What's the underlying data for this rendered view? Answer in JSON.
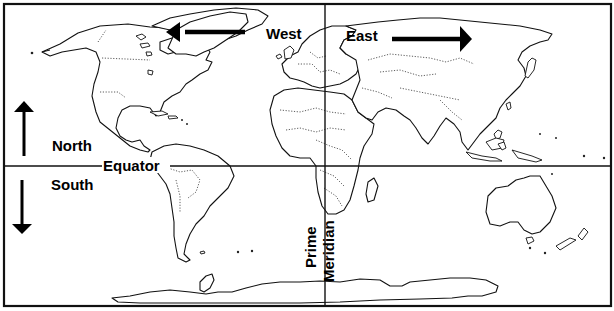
{
  "map": {
    "type": "world outline map",
    "reference_lines": {
      "equator": {
        "label": "Equator",
        "latitude": 0
      },
      "prime_meridian": {
        "label_line1": "Prime",
        "label_line2": "Meridian",
        "longitude": 0
      }
    },
    "directions": {
      "north": {
        "label": "North",
        "arrow": "up"
      },
      "south": {
        "label": "South",
        "arrow": "down"
      },
      "west": {
        "label": "West",
        "arrow": "left"
      },
      "east": {
        "label": "East",
        "arrow": "right"
      }
    },
    "continents": [
      "North America",
      "South America",
      "Europe",
      "Africa",
      "Asia",
      "Australia",
      "Antarctica"
    ],
    "style": {
      "line_color": "#111111",
      "background": "#ffffff",
      "border_style": "dotted"
    }
  }
}
